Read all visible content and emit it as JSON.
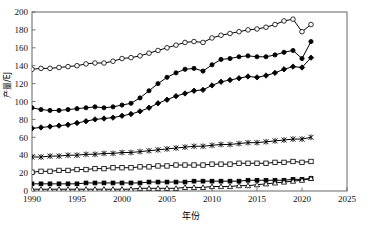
{
  "chart_data": {
    "type": "line",
    "title": "",
    "xlabel": "年份",
    "ylabel": "产量/EJ",
    "xlim": [
      1990,
      2025
    ],
    "ylim": [
      0,
      200
    ],
    "xticks": [
      1990,
      1995,
      2000,
      2005,
      2010,
      2015,
      2020,
      2025
    ],
    "yticks": [
      0,
      20,
      40,
      60,
      80,
      100,
      120,
      140,
      160,
      180,
      200
    ],
    "grid": false,
    "legend_position": "none",
    "x": [
      1990,
      1991,
      1992,
      1993,
      1994,
      1995,
      1996,
      1997,
      1998,
      1999,
      2000,
      2001,
      2002,
      2003,
      2004,
      2005,
      2006,
      2007,
      2008,
      2009,
      2010,
      2011,
      2012,
      2013,
      2014,
      2015,
      2016,
      2017,
      2018,
      2019,
      2020,
      2021
    ],
    "series": [
      {
        "name": "series-open-circle",
        "marker": "open-circle",
        "values": [
          136,
          137,
          137,
          138,
          139,
          140,
          142,
          143,
          143,
          145,
          148,
          149,
          151,
          154,
          157,
          160,
          163,
          166,
          167,
          166,
          171,
          174,
          176,
          178,
          180,
          181,
          183,
          186,
          190,
          192,
          178,
          186
        ]
      },
      {
        "name": "series-filled-circle",
        "marker": "filled-circle",
        "values": [
          93,
          91,
          90,
          90,
          91,
          92,
          93,
          94,
          93,
          94,
          96,
          98,
          104,
          112,
          120,
          127,
          132,
          136,
          137,
          134,
          141,
          147,
          148,
          150,
          151,
          150,
          150,
          152,
          155,
          157,
          148,
          167
        ]
      },
      {
        "name": "series-filled-diamond",
        "marker": "filled-diamond",
        "values": [
          70,
          71,
          72,
          73,
          74,
          76,
          78,
          80,
          81,
          82,
          84,
          86,
          89,
          93,
          98,
          102,
          106,
          109,
          112,
          113,
          118,
          122,
          124,
          126,
          128,
          127,
          129,
          132,
          136,
          139,
          138,
          149
        ]
      },
      {
        "name": "series-cross",
        "marker": "cross",
        "values": [
          38,
          38,
          39,
          39,
          40,
          40,
          41,
          41,
          42,
          42,
          43,
          43,
          44,
          45,
          46,
          47,
          48,
          49,
          50,
          50,
          51,
          52,
          52,
          53,
          54,
          54,
          55,
          56,
          57,
          58,
          58,
          60
        ]
      },
      {
        "name": "series-open-square",
        "marker": "open-square",
        "values": [
          21,
          22,
          22,
          23,
          23,
          24,
          24,
          25,
          25,
          26,
          26,
          26,
          27,
          27,
          28,
          28,
          29,
          29,
          29,
          29,
          30,
          30,
          30,
          31,
          31,
          31,
          31,
          32,
          32,
          33,
          32,
          33
        ]
      },
      {
        "name": "series-filled-square",
        "marker": "filled-square",
        "values": [
          8,
          8,
          8,
          8,
          8,
          8,
          9,
          9,
          9,
          9,
          9,
          9,
          9,
          10,
          10,
          10,
          10,
          10,
          11,
          11,
          11,
          11,
          11,
          11,
          12,
          12,
          12,
          12,
          12,
          13,
          13,
          14
        ]
      },
      {
        "name": "series-open-triangle",
        "marker": "open-triangle",
        "values": [
          2,
          2,
          2,
          2,
          2,
          2,
          2,
          2,
          2,
          2,
          2,
          2,
          3,
          3,
          3,
          3,
          3,
          4,
          4,
          4,
          5,
          5,
          5,
          6,
          6,
          7,
          8,
          9,
          10,
          11,
          12,
          14
        ]
      }
    ]
  }
}
